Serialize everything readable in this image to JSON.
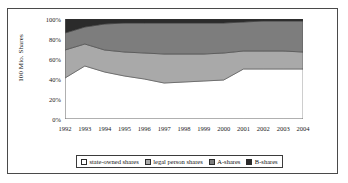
{
  "chart_data": {
    "type": "area",
    "stacked": true,
    "stack_mode": "percent",
    "title": "",
    "subtitle": "",
    "xlabel": "",
    "ylabel": "100 Mio. Shares",
    "x": [
      "1992",
      "1993",
      "1994",
      "1995",
      "1996",
      "1997",
      "1998",
      "1999",
      "2000",
      "2001",
      "2002",
      "2003",
      "2004"
    ],
    "categories": [
      "1992",
      "1993",
      "1994",
      "1995",
      "1996",
      "1997",
      "1998",
      "1999",
      "2000",
      "2001",
      "2002",
      "2003",
      "2004"
    ],
    "ylim": [
      0,
      100
    ],
    "yticks": [
      "0%",
      "20%",
      "40%",
      "60%",
      "80%",
      "100%"
    ],
    "ytick_values": [
      0,
      20,
      40,
      60,
      80,
      100
    ],
    "grid": false,
    "legend_position": "bottom",
    "series": [
      {
        "name": "state-owned shares",
        "color": "#ffffff",
        "values": [
          41,
          53,
          47,
          43,
          40,
          36,
          37,
          38,
          39,
          50,
          50,
          50,
          50
        ]
      },
      {
        "name": "legal person shares",
        "color": "#a9a9a9",
        "values": [
          28,
          22,
          22,
          24,
          26,
          29,
          28,
          27,
          27,
          18,
          18,
          18,
          17
        ]
      },
      {
        "name": "A-shares",
        "color": "#7d7d7d",
        "values": [
          17,
          17,
          26,
          29,
          30,
          31,
          31,
          31,
          30,
          29,
          30,
          30,
          31
        ]
      },
      {
        "name": "B-shares",
        "color": "#2b2b2b",
        "values": [
          14,
          8,
          5,
          4,
          4,
          4,
          4,
          4,
          4,
          3,
          2,
          2,
          2
        ]
      }
    ],
    "cumulative_tops": {
      "state-owned shares": [
        41,
        53,
        47,
        43,
        40,
        36,
        37,
        38,
        39,
        50,
        50,
        50,
        50
      ],
      "legal person shares": [
        69,
        75,
        69,
        67,
        66,
        65,
        65,
        65,
        66,
        68,
        68,
        68,
        67
      ],
      "A-shares": [
        86,
        92,
        95,
        96,
        96,
        96,
        96,
        96,
        96,
        97,
        98,
        98,
        98
      ],
      "B-shares": [
        100,
        100,
        100,
        100,
        100,
        100,
        100,
        100,
        100,
        100,
        100,
        100,
        100
      ]
    }
  },
  "axis": {
    "y_title": "100 Mio. Shares",
    "y_ticks": [
      "100%",
      "80%",
      "60%",
      "40%",
      "20%",
      "0%"
    ],
    "x_ticks": [
      "1992",
      "1993",
      "1994",
      "1995",
      "1996",
      "1997",
      "1998",
      "1999",
      "2000",
      "2001",
      "2002",
      "2003",
      "2004"
    ]
  },
  "legend": {
    "items": [
      {
        "label": "state-owned shares",
        "color": "#ffffff"
      },
      {
        "label": "legal person shares",
        "color": "#a9a9a9"
      },
      {
        "label": "A-shares",
        "color": "#7d7d7d"
      },
      {
        "label": "B-shares",
        "color": "#2b2b2b"
      }
    ]
  },
  "colors": {
    "axis_line": "#7a7a7a",
    "series_outline": "#3a3a3a",
    "frame": "#4a4a4a",
    "background": "#ffffff"
  }
}
